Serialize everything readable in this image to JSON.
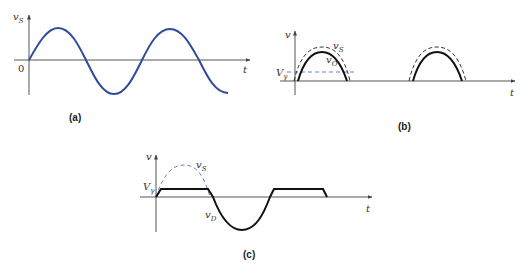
{
  "figure": {
    "panels": [
      {
        "id": "a",
        "caption": "(a)",
        "y_label": "v",
        "y_label_sub": "S",
        "x_label": "t",
        "origin_label": "0",
        "curves": [
          {
            "name": "v_S",
            "style": "solid",
            "color": "#2e4a9a",
            "description": "sinusoidal input voltage, ~2 periods starting at 0"
          }
        ]
      },
      {
        "id": "b",
        "caption": "(b)",
        "y_label": "v",
        "x_label": "t",
        "threshold_label": "V",
        "threshold_label_sub": "γ",
        "curves": [
          {
            "name": "v_S",
            "label": "v",
            "label_sub": "S",
            "style": "dashed",
            "color": "#333333",
            "description": "positive half-cycles of source"
          },
          {
            "name": "v_O",
            "label": "v",
            "label_sub": "O",
            "style": "solid",
            "color": "#111111",
            "description": "output = v_S − Vγ when v_S > Vγ, else 0"
          },
          {
            "name": "V_gamma",
            "style": "dashed",
            "color": "#6a7fc0",
            "description": "cut-in voltage level"
          }
        ]
      },
      {
        "id": "c",
        "caption": "(c)",
        "y_label": "v",
        "x_label": "t",
        "threshold_label": "V",
        "threshold_label_sub": "γ",
        "curves": [
          {
            "name": "v_S",
            "label": "v",
            "label_sub": "S",
            "style": "dashed",
            "color": "#6a7fc0",
            "description": "positive half-cycle of source"
          },
          {
            "name": "v_D",
            "label": "v",
            "label_sub": "D",
            "style": "solid",
            "color": "#111111",
            "description": "diode voltage: clamps at Vγ while conducting, follows v_S when reverse-biased"
          }
        ]
      }
    ]
  },
  "colors": {
    "axis": "#555555",
    "source_wave": "#2e4a9a",
    "output_wave": "#111111",
    "dashed_blue": "#6a7fc0"
  }
}
